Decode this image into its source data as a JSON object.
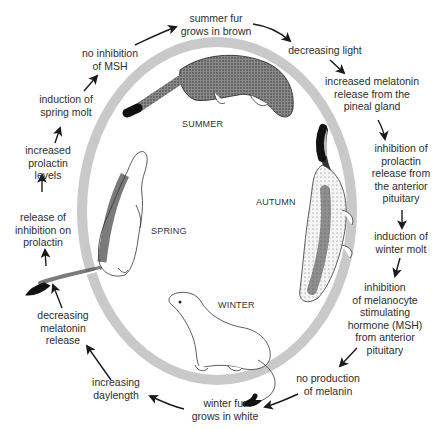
{
  "colors": {
    "ring": "#c9c9c9",
    "text": "#2d2d2d",
    "arrow": "#1a1a1a",
    "tail_tip": "#111111",
    "background": "#ffffff"
  },
  "seasons": {
    "summer": "SUMMER",
    "autumn": "AUTUMN",
    "winter": "WINTER",
    "spring": "SPRING"
  },
  "cycle_steps": [
    {
      "id": "summer-fur",
      "lines": [
        "summer fur",
        "grows in brown"
      ]
    },
    {
      "id": "decreasing-light",
      "lines": [
        "decreasing light"
      ]
    },
    {
      "id": "increased-melatonin",
      "lines": [
        "increased melatonin",
        "release from the",
        "pineal gland"
      ]
    },
    {
      "id": "inhibition-prolactin",
      "lines": [
        "inhibition of",
        "prolactin",
        "release from",
        "the anterior",
        "pituitary"
      ]
    },
    {
      "id": "winter-molt",
      "lines": [
        "induction of",
        "winter molt"
      ]
    },
    {
      "id": "inhibition-msh",
      "lines": [
        "inhibition",
        "of melanocyte",
        "stimulating",
        "hormone (MSH)",
        "from anterior",
        "pituitary"
      ]
    },
    {
      "id": "no-melanin",
      "lines": [
        "no production",
        "of melanin"
      ]
    },
    {
      "id": "winter-fur",
      "lines": [
        "winter fur",
        "grows in white"
      ]
    },
    {
      "id": "increasing-daylength",
      "lines": [
        "increasing",
        "daylength"
      ]
    },
    {
      "id": "decreasing-melatonin",
      "lines": [
        "decreasing",
        "melatonin",
        "release"
      ]
    },
    {
      "id": "release-inhibition",
      "lines": [
        "release of",
        "inhibition on",
        "prolactin"
      ]
    },
    {
      "id": "increased-prolactin",
      "lines": [
        "increased",
        "prolactin",
        "levels"
      ]
    },
    {
      "id": "spring-molt",
      "lines": [
        "induction of",
        "spring molt"
      ]
    },
    {
      "id": "no-inhibition-msh",
      "lines": [
        "no inhibition",
        "of MSH"
      ]
    }
  ]
}
